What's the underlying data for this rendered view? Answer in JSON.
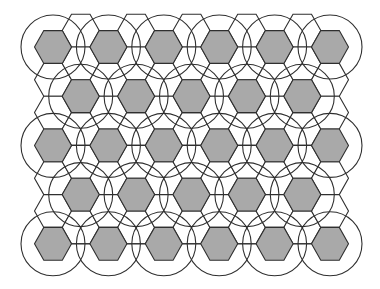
{
  "diagram": {
    "colors": {
      "background": "#ffffff",
      "line": "#2f2f2f",
      "filled_hex": "#a9a9a9",
      "empty_hex": "#ffffff"
    },
    "lattice": {
      "origin_x": 53,
      "origin_y": 47,
      "hex_radius": 18.5,
      "column_spacing": 27.7,
      "half_height": 16.4,
      "columns": 11,
      "even_column_rows": 7,
      "odd_column_rows": 7
    },
    "filled_hexes": [
      {
        "col": 0,
        "k": 0
      },
      {
        "col": 2,
        "k": 0
      },
      {
        "col": 4,
        "k": 0
      },
      {
        "col": 6,
        "k": 0
      },
      {
        "col": 8,
        "k": 0
      },
      {
        "col": 10,
        "k": 0
      },
      {
        "col": 1,
        "k": 2
      },
      {
        "col": 3,
        "k": 2
      },
      {
        "col": 5,
        "k": 2
      },
      {
        "col": 7,
        "k": 2
      },
      {
        "col": 9,
        "k": 2
      },
      {
        "col": 0,
        "k": 3
      },
      {
        "col": 2,
        "k": 3
      },
      {
        "col": 4,
        "k": 3
      },
      {
        "col": 6,
        "k": 3
      },
      {
        "col": 8,
        "k": 3
      },
      {
        "col": 10,
        "k": 3
      },
      {
        "col": 1,
        "k": 5
      },
      {
        "col": 3,
        "k": 5
      },
      {
        "col": 5,
        "k": 5
      },
      {
        "col": 7,
        "k": 5
      },
      {
        "col": 9,
        "k": 5
      },
      {
        "col": 0,
        "k": 6
      },
      {
        "col": 2,
        "k": 6
      },
      {
        "col": 4,
        "k": 6
      },
      {
        "col": 6,
        "k": 6
      },
      {
        "col": 8,
        "k": 6
      },
      {
        "col": 10,
        "k": 6
      }
    ],
    "circle_radius": 32,
    "bottom_edge_y_offset": 16.4
  }
}
